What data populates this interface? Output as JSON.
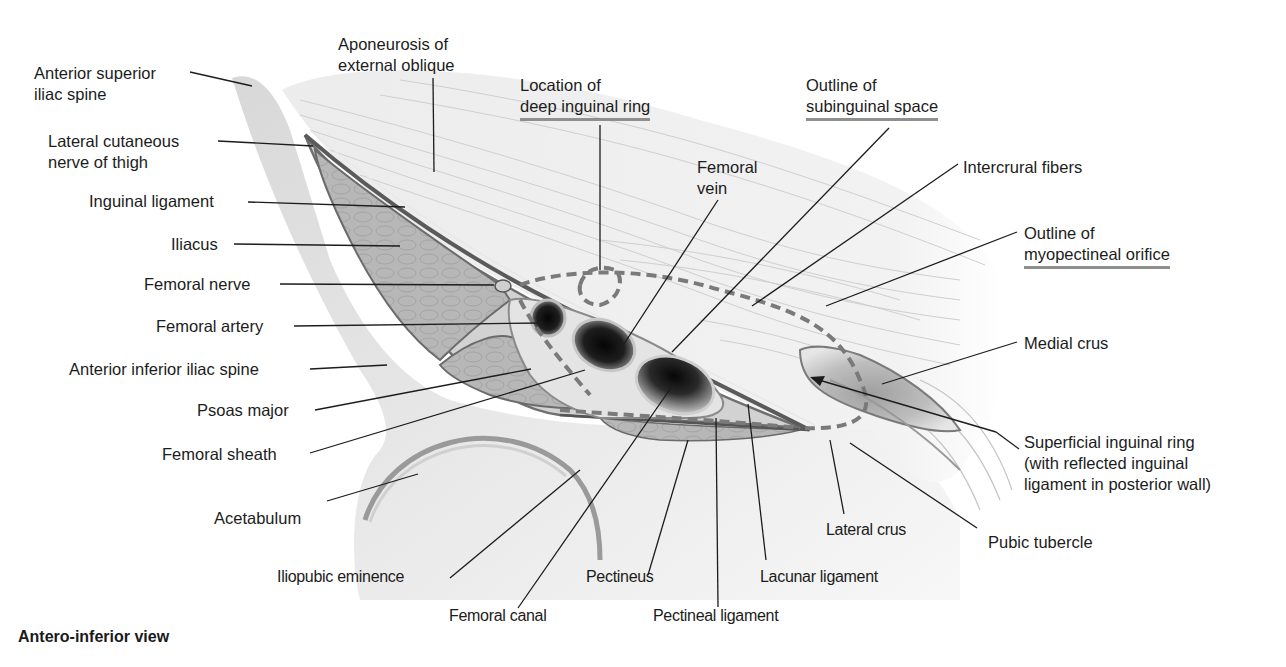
{
  "figure": {
    "view_caption": "Antero-inferior view",
    "background_color": "#ffffff",
    "leader_color": "#1c1c1c",
    "outline_dash_color": "#7a7a7a"
  },
  "labels": {
    "asis_1": "Anterior superior",
    "asis_2": "iliac spine",
    "aponeurosis_1": "Aponeurosis of",
    "aponeurosis_2": "external oblique",
    "deep_ring_1": "Location of",
    "deep_ring_2": "deep inguinal ring",
    "subinguinal_1": "Outline of",
    "subinguinal_2": "subinguinal space",
    "lcn_1": "Lateral cutaneous",
    "lcn_2": "nerve of thigh",
    "femoral_vein_1": "Femoral",
    "femoral_vein_2": "vein",
    "intercrural": "Intercrural fibers",
    "inguinal_ligament": "Inguinal ligament",
    "iliacus": "Iliacus",
    "myopectineal_1": "Outline of",
    "myopectineal_2": "myopectineal orifice",
    "femoral_nerve": "Femoral nerve",
    "femoral_artery": "Femoral artery",
    "medial_crus": "Medial crus",
    "aiis": "Anterior inferior iliac spine",
    "psoas": "Psoas major",
    "femoral_sheath": "Femoral sheath",
    "superficial_ring_1": "Superficial inguinal ring",
    "superficial_ring_2": "(with reflected inguinal",
    "superficial_ring_3": "ligament in posterior wall)",
    "acetabulum": "Acetabulum",
    "lateral_crus": "Lateral crus",
    "pubic_tubercle": "Pubic tubercle",
    "iliopubic": "Iliopubic eminence",
    "pectineus": "Pectineus",
    "lacunar": "Lacunar ligament",
    "femoral_canal": "Femoral canal",
    "pectineal_ligament": "Pectineal ligament"
  }
}
